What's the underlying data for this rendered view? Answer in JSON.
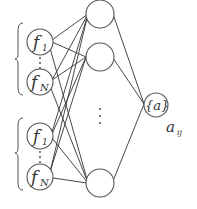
{
  "diagram": {
    "type": "neural-network",
    "input_groups": [
      {
        "nodes": [
          {
            "label": "f",
            "subscript": "1"
          },
          {
            "label": "f",
            "subscript": "N"
          }
        ],
        "ellipsis": "⋮"
      },
      {
        "nodes": [
          {
            "label": "f",
            "subscript": "1"
          },
          {
            "label": "f",
            "subscript": "N"
          }
        ],
        "ellipsis": "⋮"
      }
    ],
    "hidden_layer": {
      "node_count_visible": 3,
      "ellipsis": "⋮"
    },
    "output_node": {
      "label": "{a}"
    },
    "output_label": {
      "text": "a",
      "subscript": "ij"
    },
    "colors": {
      "stroke": "#555555",
      "edge": "#333333",
      "text": "#333333"
    }
  }
}
